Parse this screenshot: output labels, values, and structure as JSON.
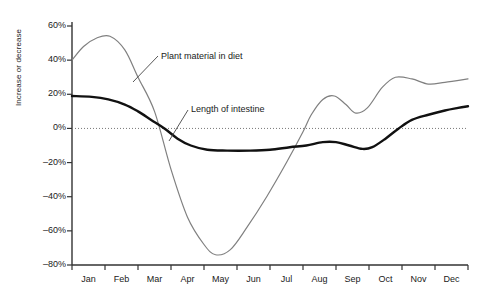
{
  "chart_data": {
    "type": "line",
    "title": "",
    "xlabel": "",
    "ylabel": "Increase or decrease",
    "ylim": [
      -80,
      60
    ],
    "yticks": [
      "60%",
      "40%",
      "20%",
      "0%",
      "–20%",
      "–40%",
      "–60%",
      "–80%"
    ],
    "ytick_values": [
      60,
      40,
      20,
      0,
      -20,
      -40,
      -60,
      -80
    ],
    "categories": [
      "Jan",
      "Feb",
      "Mar",
      "Apr",
      "May",
      "Jun",
      "Jul",
      "Aug",
      "Sep",
      "Oct",
      "Nov",
      "Dec"
    ],
    "grid": false,
    "zero_line": true,
    "legend_position": "inline-annotations",
    "series": [
      {
        "name": "Plant material in diet",
        "color": "#808080",
        "width": 1.2,
        "values": [
          40,
          52,
          18,
          -62,
          -72,
          -42,
          -4,
          18,
          10,
          28,
          25,
          29
        ],
        "points": [
          [
            0.0,
            40
          ],
          [
            0.35,
            48
          ],
          [
            0.75,
            53
          ],
          [
            1.15,
            54
          ],
          [
            1.6,
            46
          ],
          [
            2.0,
            30
          ],
          [
            2.5,
            10
          ],
          [
            3.0,
            -24
          ],
          [
            3.5,
            -52
          ],
          [
            4.0,
            -68
          ],
          [
            4.35,
            -74
          ],
          [
            4.8,
            -71
          ],
          [
            5.3,
            -58
          ],
          [
            5.9,
            -40
          ],
          [
            6.5,
            -20
          ],
          [
            7.0,
            -2
          ],
          [
            7.25,
            8
          ],
          [
            7.6,
            17
          ],
          [
            7.95,
            19
          ],
          [
            8.3,
            14
          ],
          [
            8.6,
            9
          ],
          [
            8.95,
            12
          ],
          [
            9.4,
            24
          ],
          [
            9.8,
            30
          ],
          [
            10.3,
            29
          ],
          [
            10.8,
            26
          ],
          [
            11.3,
            27
          ],
          [
            12.0,
            29
          ]
        ]
      },
      {
        "name": "Length of intestine",
        "color": "#111111",
        "width": 2.4,
        "values": [
          19,
          18,
          4,
          -12,
          -13,
          -13,
          -12,
          -8,
          -12,
          2,
          10,
          13
        ],
        "points": [
          [
            0.0,
            19
          ],
          [
            0.6,
            18.5
          ],
          [
            1.1,
            17
          ],
          [
            1.6,
            14
          ],
          [
            2.0,
            10
          ],
          [
            2.4,
            5
          ],
          [
            2.8,
            0
          ],
          [
            3.2,
            -6
          ],
          [
            3.6,
            -10
          ],
          [
            4.1,
            -12.5
          ],
          [
            4.7,
            -13
          ],
          [
            5.4,
            -13
          ],
          [
            6.0,
            -12.5
          ],
          [
            6.6,
            -11
          ],
          [
            7.1,
            -10
          ],
          [
            7.6,
            -8
          ],
          [
            8.0,
            -8
          ],
          [
            8.4,
            -10
          ],
          [
            8.8,
            -12
          ],
          [
            9.1,
            -11
          ],
          [
            9.5,
            -6
          ],
          [
            9.9,
            0
          ],
          [
            10.3,
            5
          ],
          [
            10.8,
            8
          ],
          [
            11.3,
            10.5
          ],
          [
            11.7,
            12
          ],
          [
            12.0,
            13
          ]
        ]
      }
    ],
    "annotations": [
      {
        "text": "Plant material in diet",
        "label_x": 161,
        "label_y": 57,
        "leader": [
          [
            158,
            56
          ],
          [
            133,
            82
          ]
        ]
      },
      {
        "text": "Length of intestine",
        "label_x": 191,
        "label_y": 110,
        "leader": [
          [
            188,
            110
          ],
          [
            169,
            141
          ]
        ]
      }
    ]
  }
}
